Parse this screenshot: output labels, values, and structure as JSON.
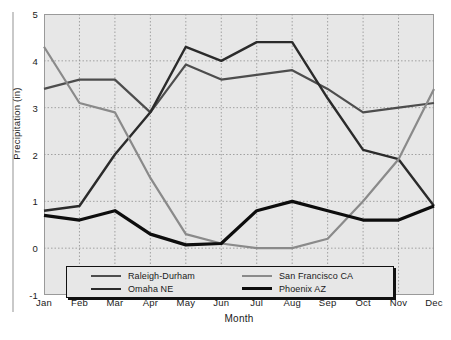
{
  "chart_data": {
    "type": "line",
    "title": "",
    "xlabel": "Month",
    "ylabel": "Precipitation (in)",
    "categories": [
      "Jan",
      "Feb",
      "Mar",
      "Apr",
      "May",
      "Jun",
      "Jul",
      "Aug",
      "Sep",
      "Oct",
      "Nov",
      "Dec"
    ],
    "ylim": [
      -1,
      5
    ],
    "yticks": [
      "5",
      "4",
      "3",
      "2",
      "1",
      "0",
      "-1"
    ],
    "ytick_values": [
      5,
      4,
      3,
      2,
      1,
      0,
      -1
    ],
    "grid": true,
    "legend_position": "bottom-inside",
    "series": [
      {
        "name": "Raleigh-Durham",
        "color": "#4d4d4d",
        "width": 2.2,
        "values": [
          3.4,
          3.6,
          3.6,
          2.9,
          3.92,
          3.6,
          3.7,
          3.8,
          3.4,
          2.9,
          3.0,
          3.1
        ]
      },
      {
        "name": "Omaha NE",
        "color": "#2b2b2b",
        "width": 2.4,
        "values": [
          0.8,
          0.9,
          2.0,
          2.9,
          4.3,
          4.0,
          4.4,
          4.4,
          3.2,
          2.1,
          1.9,
          0.9
        ]
      },
      {
        "name": "San Francisco CA",
        "color": "#8a8a8a",
        "width": 2.2,
        "values": [
          4.3,
          3.1,
          2.9,
          1.5,
          0.3,
          0.1,
          0.0,
          0.0,
          0.2,
          1.0,
          1.9,
          3.4
        ]
      },
      {
        "name": "Phoenix AZ",
        "color": "#0d0d0d",
        "width": 3.2,
        "values": [
          0.7,
          0.6,
          0.8,
          0.3,
          0.07,
          0.1,
          0.8,
          1.0,
          0.8,
          0.6,
          0.6,
          0.9
        ]
      }
    ]
  },
  "legend": {
    "items": [
      {
        "label": "Raleigh-Durham",
        "color": "#4d4d4d",
        "width": 2.2
      },
      {
        "label": "San Francisco CA",
        "color": "#8a8a8a",
        "width": 2.2
      },
      {
        "label": "Omaha NE",
        "color": "#2b2b2b",
        "width": 2.6
      },
      {
        "label": "Phoenix AZ",
        "color": "#0d0d0d",
        "width": 3.4
      }
    ]
  }
}
